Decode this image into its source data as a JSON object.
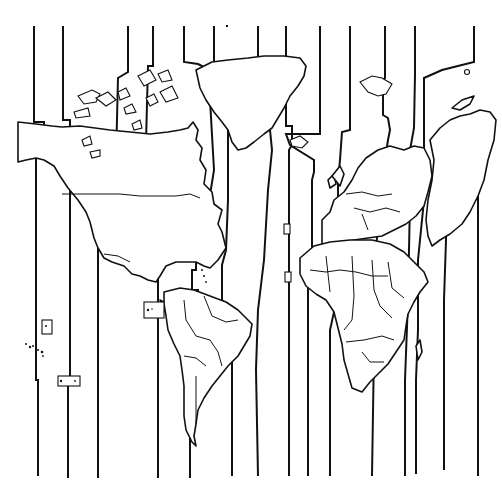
{
  "map": {
    "title": "World Time Zones",
    "style": "black line-art outline map",
    "colors": {
      "background": "#ffffff",
      "line": "#111111"
    },
    "regions_shown": [
      "North America",
      "Greenland",
      "South America",
      "Europe",
      "Africa",
      "Asia (partial)",
      "Pacific islands"
    ],
    "time_zone_line_count": 20,
    "labels": []
  }
}
